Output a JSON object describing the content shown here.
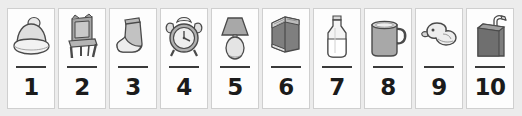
{
  "worksheet": {
    "background_color": "#ececec",
    "card_background": "#fdfdfd",
    "card_border_color": "#cfcfcf",
    "rule_color": "#3a3a3a",
    "number_color": "#1b1b1b",
    "card_count": 10
  },
  "cards": [
    {
      "number": "1",
      "icon": "beanie-hat-icon",
      "object": "winter hat"
    },
    {
      "number": "2",
      "icon": "chair-icon",
      "object": "chair"
    },
    {
      "number": "3",
      "icon": "sock-icon",
      "object": "sock"
    },
    {
      "number": "4",
      "icon": "alarm-clock-icon",
      "object": "alarm clock"
    },
    {
      "number": "5",
      "icon": "table-lamp-icon",
      "object": "lamp"
    },
    {
      "number": "6",
      "icon": "book-icon",
      "object": "book"
    },
    {
      "number": "7",
      "icon": "milk-bottle-icon",
      "object": "bottle"
    },
    {
      "number": "8",
      "icon": "mug-icon",
      "object": "mug"
    },
    {
      "number": "9",
      "icon": "rubber-duck-icon",
      "object": "rubber duck"
    },
    {
      "number": "10",
      "icon": "juice-box-icon",
      "object": "juice box"
    }
  ]
}
